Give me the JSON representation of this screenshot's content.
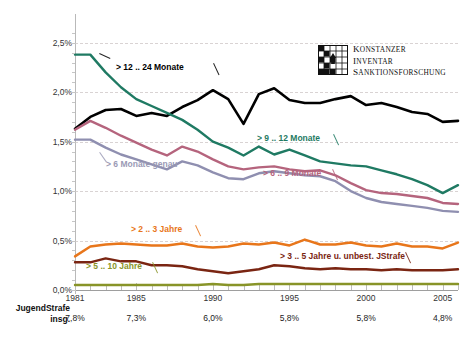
{
  "chart_data": {
    "type": "line",
    "title": "",
    "xlabel": "",
    "ylabel": "",
    "xlim": [
      1981,
      2006
    ],
    "ylim": [
      0.0,
      2.75
    ],
    "grid": true,
    "legend_position": "inline-annotations",
    "ytick_labels": [
      "0,0%",
      "0,5%",
      "1,0%",
      "1,5%",
      "2,0%",
      "2,5%"
    ],
    "ytick_values": [
      0.0,
      0.5,
      1.0,
      1.5,
      2.0,
      2.5
    ],
    "xtick_labels": [
      "1981",
      "1985",
      "1990",
      "1995",
      "2000",
      "2005"
    ],
    "xtick_values": [
      1981,
      1985,
      1990,
      1995,
      2000,
      2005
    ],
    "x": [
      1981,
      1982,
      1983,
      1984,
      1985,
      1986,
      1987,
      1988,
      1989,
      1990,
      1991,
      1992,
      1993,
      1994,
      1995,
      1996,
      1997,
      1998,
      1999,
      2000,
      2001,
      2002,
      2003,
      2004,
      2005,
      2006
    ],
    "series": [
      {
        "name": "> 12 .. 24 Monate",
        "color": "#000000",
        "values": [
          1.63,
          1.75,
          1.82,
          1.83,
          1.76,
          1.79,
          1.76,
          1.85,
          1.92,
          2.02,
          1.93,
          1.68,
          1.98,
          2.04,
          1.92,
          1.89,
          1.89,
          1.93,
          1.96,
          1.87,
          1.89,
          1.85,
          1.8,
          1.78,
          1.7,
          1.71
        ]
      },
      {
        "name": "> 9 .. 12 Monate",
        "color": "#1f7a63",
        "values": [
          2.38,
          2.38,
          2.2,
          2.05,
          1.93,
          1.86,
          1.79,
          1.72,
          1.62,
          1.5,
          1.44,
          1.36,
          1.45,
          1.37,
          1.42,
          1.36,
          1.3,
          1.28,
          1.26,
          1.25,
          1.21,
          1.17,
          1.12,
          1.06,
          0.98,
          1.06
        ]
      },
      {
        "name": "> 6 .. 9 Monate",
        "color": "#b5647d",
        "values": [
          1.62,
          1.71,
          1.64,
          1.56,
          1.49,
          1.42,
          1.36,
          1.45,
          1.4,
          1.32,
          1.25,
          1.22,
          1.24,
          1.25,
          1.22,
          1.2,
          1.21,
          1.16,
          1.08,
          1.01,
          0.98,
          0.97,
          0.95,
          0.93,
          0.88,
          0.87
        ]
      },
      {
        "name": "> 6 Monate genau",
        "color": "#8f8fb0",
        "values": [
          1.52,
          1.52,
          1.44,
          1.37,
          1.32,
          1.27,
          1.22,
          1.3,
          1.26,
          1.19,
          1.13,
          1.12,
          1.18,
          1.2,
          1.18,
          1.16,
          1.15,
          1.1,
          1.0,
          0.93,
          0.89,
          0.87,
          0.85,
          0.83,
          0.8,
          0.79
        ]
      },
      {
        "name": "> 2 .. 3 Jahre",
        "color": "#e8761b",
        "values": [
          0.34,
          0.44,
          0.46,
          0.47,
          0.46,
          0.45,
          0.45,
          0.47,
          0.44,
          0.43,
          0.44,
          0.47,
          0.46,
          0.48,
          0.45,
          0.51,
          0.46,
          0.46,
          0.48,
          0.45,
          0.44,
          0.47,
          0.44,
          0.44,
          0.42,
          0.48
        ]
      },
      {
        "name": "> 3 .. 5 Jahre u. unbest. JStrafe",
        "color": "#7a2512",
        "values": [
          0.28,
          0.28,
          0.32,
          0.29,
          0.29,
          0.25,
          0.25,
          0.24,
          0.21,
          0.19,
          0.17,
          0.19,
          0.21,
          0.25,
          0.24,
          0.22,
          0.21,
          0.22,
          0.21,
          0.21,
          0.2,
          0.21,
          0.2,
          0.2,
          0.2,
          0.21
        ]
      },
      {
        "name": "> 5 .. 10 Jahre",
        "color": "#889428",
        "values": [
          0.05,
          0.05,
          0.05,
          0.05,
          0.05,
          0.05,
          0.05,
          0.05,
          0.05,
          0.06,
          0.05,
          0.05,
          0.06,
          0.06,
          0.06,
          0.06,
          0.06,
          0.06,
          0.06,
          0.06,
          0.06,
          0.06,
          0.06,
          0.06,
          0.06,
          0.06
        ]
      }
    ],
    "annotations": [
      {
        "label": "> 12 .. 24 Monate",
        "color": "#000000",
        "x": 116,
        "y": 62
      },
      {
        "label": "> 9 .. 12 Monate",
        "color": "#1f7a63",
        "x": 257,
        "y": 133
      },
      {
        "label": "> 6 .. 9 Monate",
        "color": "#b5647d",
        "x": 263,
        "y": 168
      },
      {
        "label": "> 6 Monate genau",
        "color": "#9a9ab5",
        "x": 106,
        "y": 159
      },
      {
        "label": "> 2 .. 3 Jahre",
        "color": "#e8761b",
        "x": 131,
        "y": 224
      },
      {
        "label": "> 3 .. 5 Jahre u. unbest. JStrafe",
        "color": "#7a2512",
        "x": 280,
        "y": 251
      },
      {
        "label": "> 5 .. 10 Jahre",
        "color": "#889428",
        "x": 86,
        "y": 261
      }
    ],
    "footer": {
      "label_line1": "JugendStrafe",
      "label_line2": "insg.",
      "values": [
        "7,8%",
        "7,3%",
        "6,0%",
        "5,8%",
        "5,8%",
        "4,8%"
      ],
      "value_years": [
        1981,
        1985,
        1990,
        1995,
        2000,
        2005
      ]
    }
  },
  "logo": {
    "mark_name": "konstanzer-inventar-grid-mark",
    "line1": "Konstanzer",
    "line2": "Inventar",
    "line3": "Sanktionsforschung"
  }
}
